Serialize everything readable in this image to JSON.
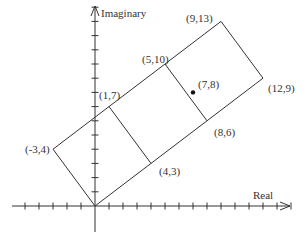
{
  "axes": {
    "x_label": "Real",
    "y_label": "Imaginary",
    "x_ticks": [
      -5,
      -4,
      -3,
      -2,
      -1,
      1,
      2,
      3,
      4,
      5,
      6,
      7,
      8,
      9,
      10,
      11,
      12,
      13,
      14
    ],
    "y_ticks": [
      1,
      2,
      3,
      4,
      5,
      6,
      7,
      8,
      9,
      10,
      11,
      12,
      13,
      14
    ],
    "color": "#333333"
  },
  "mapping": {
    "origin_px": [
      95,
      206
    ],
    "unit_x": 14,
    "unit_y": 14.2
  },
  "polygon": {
    "outer_vertices": [
      [
        0,
        0
      ],
      [
        12,
        9
      ],
      [
        9,
        13
      ],
      [
        -3,
        4
      ]
    ],
    "color": "#333333"
  },
  "inner_lines": [
    {
      "from": [
        1,
        7
      ],
      "to": [
        4,
        3
      ]
    },
    {
      "from": [
        5,
        10
      ],
      "to": [
        8,
        6
      ]
    }
  ],
  "points": [
    {
      "label": "(9,13)",
      "x": 9,
      "y": 13
    },
    {
      "label": "(5,10)",
      "x": 5,
      "y": 10
    },
    {
      "label": "(1,7)",
      "x": 1,
      "y": 7
    },
    {
      "label": "(-3,4)",
      "x": -3,
      "y": 4
    },
    {
      "label": "(12,9)",
      "x": 12,
      "y": 9
    },
    {
      "label": "(8,6)",
      "x": 8,
      "y": 6
    },
    {
      "label": "(4,3)",
      "x": 4,
      "y": 3
    },
    {
      "label": "(7,8)",
      "x": 7,
      "y": 8,
      "dot": true
    }
  ]
}
